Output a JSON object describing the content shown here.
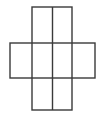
{
  "figure": {
    "background_color": "#ffffff",
    "stroke_color": "#3a3a3a",
    "stroke_width": 1.4,
    "canvas": {
      "width": 104,
      "height": 118
    },
    "rects": [
      {
        "name": "vertical-rectangle",
        "x": 32,
        "y": 7,
        "w": 40,
        "h": 103
      },
      {
        "name": "horizontal-rectangle",
        "x": 10,
        "y": 43,
        "w": 85,
        "h": 35
      }
    ],
    "lines": [
      {
        "name": "center-vertical-line",
        "x1": 52.5,
        "y1": 7,
        "x2": 52.5,
        "y2": 110
      }
    ]
  }
}
